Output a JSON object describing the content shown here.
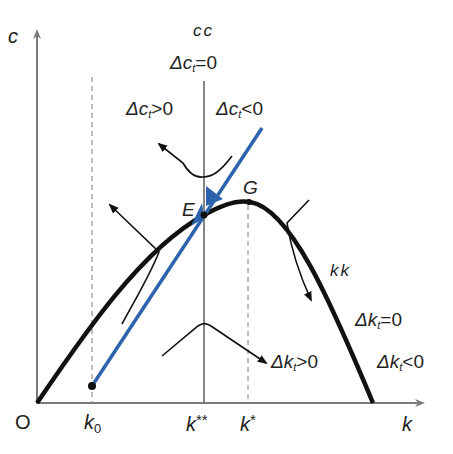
{
  "diagram": {
    "axes": {
      "y_label": "c",
      "x_label": "k",
      "origin_label": "O"
    },
    "x_ticks": [
      {
        "label": "k",
        "sub": "0",
        "id": "k0"
      },
      {
        "label": "k",
        "sup": "**",
        "id": "k_double_star"
      },
      {
        "label": "k",
        "sup": "*",
        "id": "k_star"
      }
    ],
    "loci": {
      "cc": {
        "name": "cc",
        "condition_symbol": "Δc",
        "condition_sub": "t",
        "condition_rest": "=0",
        "left_region": {
          "symbol": "Δc",
          "sub": "t",
          "rest": ">0"
        },
        "right_region": {
          "symbol": "Δc",
          "sub": "t",
          "rest": "<0"
        }
      },
      "kk": {
        "name": "kk",
        "condition_symbol": "Δk",
        "condition_sub": "t",
        "condition_rest": "=0",
        "below_region": {
          "symbol": "Δk",
          "sub": "t",
          "rest": ">0"
        },
        "outside_region": {
          "symbol": "Δk",
          "sub": "t",
          "rest": "<0"
        }
      }
    },
    "points": {
      "E": "E",
      "G": "G"
    },
    "colors": {
      "axis": "#7a7a7a",
      "curve": "#111111",
      "saddle_path": "#2d62ad",
      "dashed": "#7a7a7a",
      "text": "#222222"
    }
  }
}
